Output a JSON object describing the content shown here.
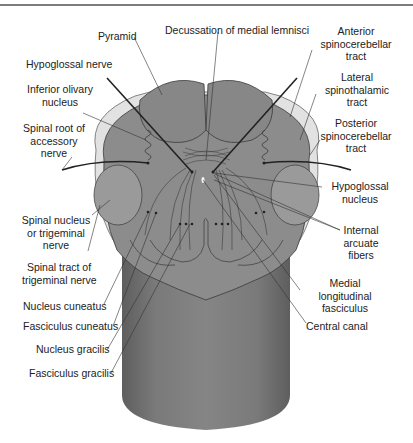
{
  "figure": {
    "colors": {
      "background": "#ffffff",
      "rule": "#7d7d7d",
      "tissue": "#8c8c8c",
      "tissue_dark": "#6f6f6f",
      "pyramid": "#8a8a8a",
      "light_tract": "#e2e2e2",
      "outline": "#3a3a3a",
      "leader_line": "#333333",
      "label_text": "#222222"
    }
  },
  "labels": {
    "pyramid": "Pyramid",
    "decussation": "Decussation of medial lemnisci",
    "anterior_spinocerebellar": [
      "Anterior",
      "spinocerebellar",
      "tract"
    ],
    "hypoglossal_nerve": "Hypoglossal nerve",
    "lateral_spinothalamic": [
      "Lateral",
      "spinothalamic",
      "tract"
    ],
    "inferior_olivary": [
      "Inferior olivary",
      "nucleus"
    ],
    "posterior_spinocerebellar": [
      "Posterior",
      "spinocerebellar",
      "tract"
    ],
    "spinal_root_accessory": [
      "Spinal root of",
      "accessory",
      "nerve"
    ],
    "hypoglossal_nucleus": [
      "Hypoglossal",
      "nucleus"
    ],
    "spinal_nucleus_trigeminal": [
      "Spinal nucleus",
      "or trigeminal",
      "nerve"
    ],
    "internal_arcuate": [
      "Internal",
      "arcuate",
      "fibers"
    ],
    "spinal_tract_trigeminal": [
      "Spinal tract of",
      "trigeminal nerve"
    ],
    "medial_longitudinal": [
      "Medial",
      "longitudinal",
      "fasciculus"
    ],
    "nucleus_cuneatus": "Nucleus cuneatus",
    "fasciculus_cuneatus": "Fasciculus cuneatus",
    "central_canal": "Central canal",
    "nucleus_gracilis": "Nucleus gracilis",
    "fasciculus_gracilis": "Fasciculus gracilis"
  }
}
